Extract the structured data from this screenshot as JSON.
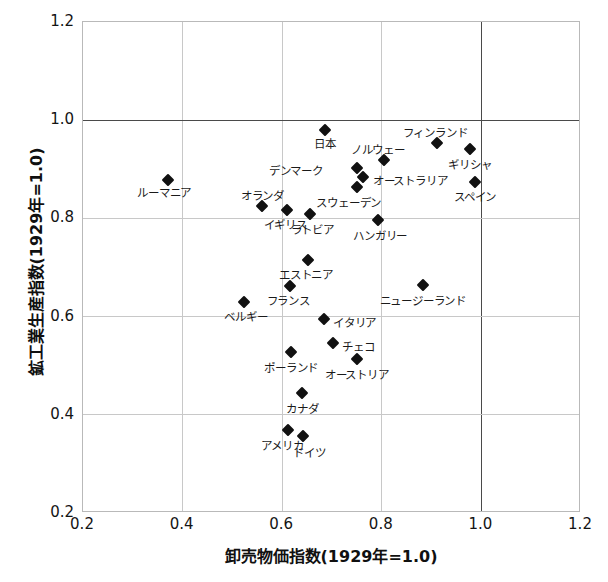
{
  "chart_data": {
    "type": "scatter",
    "title": "",
    "xlabel": "卸売物価指数(1929年=1.0)",
    "ylabel": "鉱工業生産指数(1929年=1.0)",
    "xlim": [
      0.2,
      1.2
    ],
    "ylim": [
      0.2,
      1.2
    ],
    "xticks": [
      "0.2",
      "0.4",
      "0.6",
      "0.8",
      "1.0",
      "1.2"
    ],
    "xtick_values": [
      0.2,
      0.4,
      0.6,
      0.8,
      1.0,
      1.2
    ],
    "yticks": [
      "0.2",
      "0.4",
      "0.6",
      "0.8",
      "1.0",
      "1.2"
    ],
    "ytick_values": [
      0.2,
      0.4,
      0.6,
      0.8,
      1.0,
      1.2
    ],
    "grid": true,
    "emphasized_gridlines": {
      "x": 1.0,
      "y": 1.0
    },
    "legend": "none",
    "marker": "diamond",
    "marker_color": "#111111",
    "grid_color": "#c8c8c8",
    "points": [
      {
        "label": "ルーマニア",
        "x": 0.373,
        "y": 0.876,
        "label_dx": -4,
        "label_dy": 13,
        "label_align": "center"
      },
      {
        "label": "日本",
        "x": 0.688,
        "y": 0.978,
        "label_dx": 0,
        "label_dy": 14,
        "label_align": "center"
      },
      {
        "label": "フィンランド",
        "x": 0.913,
        "y": 0.952,
        "label_dx": -2,
        "label_dy": -10,
        "label_align": "center"
      },
      {
        "label": "ギリシャ",
        "x": 0.979,
        "y": 0.94,
        "label_dx": 0,
        "label_dy": 16,
        "label_align": "center"
      },
      {
        "label": "ノルウェー",
        "x": 0.806,
        "y": 0.917,
        "label_dx": -6,
        "label_dy": -10,
        "label_align": "center"
      },
      {
        "label": "デンマーク",
        "x": 0.752,
        "y": 0.901,
        "label_dx": -34,
        "label_dy": 3,
        "label_align": "right"
      },
      {
        "label": "オーストラリア",
        "x": 0.764,
        "y": 0.882,
        "label_dx": 10,
        "label_dy": 4,
        "label_align": "left"
      },
      {
        "label": "スウェーデン",
        "x": 0.752,
        "y": 0.862,
        "label_dx": -8,
        "label_dy": 16,
        "label_align": "center"
      },
      {
        "label": "スペイン",
        "x": 0.989,
        "y": 0.873,
        "label_dx": 0,
        "label_dy": 15,
        "label_align": "center"
      },
      {
        "label": "オランダ",
        "x": 0.562,
        "y": 0.823,
        "label_dx": 0,
        "label_dy": -10,
        "label_align": "center"
      },
      {
        "label": "イギリス",
        "x": 0.612,
        "y": 0.815,
        "label_dx": -2,
        "label_dy": 15,
        "label_align": "center"
      },
      {
        "label": "ラトビア",
        "x": 0.658,
        "y": 0.807,
        "label_dx": 2,
        "label_dy": 16,
        "label_align": "center"
      },
      {
        "label": "ハンガリー",
        "x": 0.795,
        "y": 0.795,
        "label_dx": 2,
        "label_dy": 16,
        "label_align": "center"
      },
      {
        "label": "エストニア",
        "x": 0.654,
        "y": 0.714,
        "label_dx": -2,
        "label_dy": 15,
        "label_align": "center"
      },
      {
        "label": "ニュージーランド",
        "x": 0.884,
        "y": 0.662,
        "label_dx": 0,
        "label_dy": 16,
        "label_align": "center"
      },
      {
        "label": "フランス",
        "x": 0.618,
        "y": 0.661,
        "label_dx": -2,
        "label_dy": 15,
        "label_align": "center"
      },
      {
        "label": "ベルギー",
        "x": 0.525,
        "y": 0.628,
        "label_dx": 2,
        "label_dy": 15,
        "label_align": "center"
      },
      {
        "label": "イタリア",
        "x": 0.686,
        "y": 0.594,
        "label_dx": 9,
        "label_dy": 4,
        "label_align": "left"
      },
      {
        "label": "チェコ",
        "x": 0.704,
        "y": 0.545,
        "label_dx": 9,
        "label_dy": 4,
        "label_align": "left"
      },
      {
        "label": "オーストリア",
        "x": 0.752,
        "y": 0.511,
        "label_dx": 0,
        "label_dy": 16,
        "label_align": "center"
      },
      {
        "label": "ポーランド",
        "x": 0.62,
        "y": 0.525,
        "label_dx": 0,
        "label_dy": 16,
        "label_align": "center"
      },
      {
        "label": "カナダ",
        "x": 0.642,
        "y": 0.442,
        "label_dx": 0,
        "label_dy": 16,
        "label_align": "center"
      },
      {
        "label": "アメリカ",
        "x": 0.614,
        "y": 0.367,
        "label_dx": -6,
        "label_dy": 16,
        "label_align": "center"
      },
      {
        "label": "ドイツ",
        "x": 0.644,
        "y": 0.355,
        "label_dx": 6,
        "label_dy": 17,
        "label_align": "center"
      }
    ]
  }
}
